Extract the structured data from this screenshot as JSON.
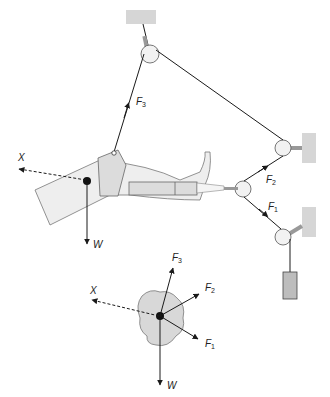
{
  "diagram": {
    "labels": {
      "X": "X",
      "W": "W",
      "F": "F",
      "F1_sub": "1",
      "F2_sub": "2",
      "F3_sub": "3"
    },
    "free_body": {
      "labels": {
        "X": "X",
        "W": "W",
        "F": "F",
        "F1_sub": "1",
        "F2_sub": "2",
        "F3_sub": "3"
      }
    },
    "colors": {
      "line": "#1a1a1a",
      "wall": "#d6d6d6",
      "skin": "#eeeeee",
      "bandage": "#dcdcdc",
      "blob": "#d8d8d8",
      "weight": "#bdbdbd"
    }
  }
}
